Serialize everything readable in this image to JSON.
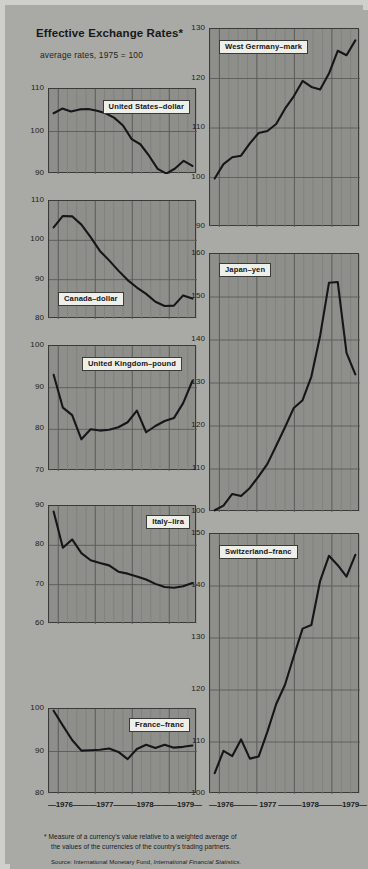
{
  "header": {
    "title": "Effective Exchange Rates*",
    "subtitle": "average rates, 1975 = 100"
  },
  "footnote": {
    "marker": "*",
    "line1": "Measure of a currency's value relative to a weighted average of",
    "line2": "the values of the currencies of the country's trading partners.",
    "source_prefix": "Source: International Monetary Fund, ",
    "source_italic": "International Financial Statistics."
  },
  "axis": {
    "years": [
      "1976",
      "1977",
      "1978",
      "1979"
    ],
    "left_label": "—1976———1977———1978———1979—",
    "right_label": "—1976——— 1977 ———1978———1979—"
  },
  "colors": {
    "background": "#a9aaa5",
    "plot_fill": "#8e8f8a",
    "plot_border": "#3a3b39",
    "line": "#15161a",
    "grid_minor": "#7e7f7b",
    "grid_major": "#5a5b58",
    "label_bg": "#efefea"
  },
  "chart_data": [
    {
      "type": "line",
      "title": "United States–dollar",
      "xlabel": "",
      "ylabel": "",
      "ylim": [
        90,
        110
      ],
      "yticks": [
        90,
        100,
        110
      ],
      "xlim": [
        1975.75,
        1979.75
      ],
      "grid": true,
      "legend": "inside-top-right",
      "x": [
        1975.875,
        1976.125,
        1976.375,
        1976.625,
        1976.875,
        1977.125,
        1977.375,
        1977.625,
        1977.875,
        1978.125,
        1978.375,
        1978.625,
        1978.875,
        1979.125,
        1979.375,
        1979.625
      ],
      "values": [
        104.3,
        105.4,
        104.7,
        105.2,
        105.3,
        104.9,
        104.3,
        103.2,
        101.4,
        98.2,
        97.0,
        94.3,
        91.2,
        90.1,
        91.3,
        93.1,
        91.9
      ]
    },
    {
      "type": "line",
      "title": "Canada–dollar",
      "xlabel": "",
      "ylabel": "",
      "ylim": [
        80,
        110
      ],
      "yticks": [
        80,
        90,
        100,
        110
      ],
      "xlim": [
        1975.75,
        1979.75
      ],
      "grid": true,
      "legend": "inside-bottom-left",
      "x": [
        1975.875,
        1976.125,
        1976.375,
        1976.625,
        1976.875,
        1977.125,
        1977.375,
        1977.625,
        1977.875,
        1978.125,
        1978.375,
        1978.625,
        1978.875,
        1979.125,
        1979.375,
        1979.625
      ],
      "values": [
        103.3,
        106.2,
        106.1,
        104.0,
        100.8,
        97.3,
        94.9,
        92.3,
        89.9,
        88.0,
        86.4,
        84.4,
        83.3,
        83.4,
        86.0,
        85.2
      ]
    },
    {
      "type": "line",
      "title": "United Kingdom–pound",
      "xlabel": "",
      "ylabel": "",
      "ylim": [
        70,
        100
      ],
      "yticks": [
        70,
        80,
        90,
        100
      ],
      "xlim": [
        1975.75,
        1979.75
      ],
      "grid": true,
      "legend": "inside-top-center",
      "x": [
        1975.875,
        1976.125,
        1976.375,
        1976.625,
        1976.875,
        1977.125,
        1977.375,
        1977.625,
        1977.875,
        1978.125,
        1978.375,
        1978.625,
        1978.875,
        1979.125,
        1979.375,
        1979.625
      ],
      "values": [
        93.1,
        85.2,
        83.4,
        77.6,
        80.0,
        79.7,
        79.9,
        80.5,
        81.7,
        84.5,
        79.3,
        80.8,
        82.0,
        82.7,
        86.3,
        91.6
      ]
    },
    {
      "type": "line",
      "title": "Italy–lira",
      "xlabel": "",
      "ylabel": "",
      "ylim": [
        60,
        90
      ],
      "yticks": [
        60,
        70,
        80,
        90
      ],
      "xlim": [
        1975.75,
        1979.75
      ],
      "grid": true,
      "legend": "inside-top-right",
      "x": [
        1975.875,
        1976.125,
        1976.375,
        1976.625,
        1976.875,
        1977.125,
        1977.375,
        1977.625,
        1977.875,
        1978.125,
        1978.375,
        1978.625,
        1978.875,
        1979.125,
        1979.375,
        1979.625
      ],
      "values": [
        88.6,
        79.4,
        81.5,
        78.0,
        76.2,
        75.5,
        74.9,
        73.3,
        72.8,
        72.1,
        71.3,
        70.2,
        69.4,
        69.2,
        69.6,
        70.4
      ]
    },
    {
      "type": "line",
      "title": "France–franc",
      "xlabel": "",
      "ylabel": "",
      "ylim": [
        80,
        100
      ],
      "yticks": [
        80,
        90,
        100
      ],
      "xlim": [
        1975.75,
        1979.75
      ],
      "grid": true,
      "legend": "inside-top-right",
      "x": [
        1975.875,
        1976.125,
        1976.375,
        1976.625,
        1976.875,
        1977.125,
        1977.375,
        1977.625,
        1977.875,
        1978.125,
        1978.375,
        1978.625,
        1978.875,
        1979.125,
        1979.375,
        1979.625
      ],
      "values": [
        99.6,
        96.1,
        92.7,
        90.2,
        90.3,
        90.4,
        90.7,
        89.9,
        88.2,
        90.6,
        91.6,
        90.8,
        91.6,
        90.9,
        91.1,
        91.4
      ]
    },
    {
      "type": "line",
      "title": "West Germany–mark",
      "xlabel": "",
      "ylabel": "",
      "ylim": [
        90,
        130
      ],
      "yticks": [
        90,
        100,
        110,
        120,
        130
      ],
      "xlim": [
        1975.75,
        1979.75
      ],
      "grid": true,
      "legend": "inside-top-left",
      "x": [
        1975.875,
        1976.125,
        1976.375,
        1976.625,
        1976.875,
        1977.125,
        1977.375,
        1977.625,
        1977.875,
        1978.125,
        1978.375,
        1978.625,
        1978.875,
        1979.125,
        1979.375,
        1979.625
      ],
      "values": [
        99.8,
        102.7,
        104.1,
        104.4,
        106.9,
        109.0,
        109.4,
        110.8,
        113.9,
        116.4,
        119.5,
        118.3,
        117.8,
        121.0,
        125.6,
        124.7,
        127.7
      ]
    },
    {
      "type": "line",
      "title": "Japan–yen",
      "xlabel": "",
      "ylabel": "",
      "ylim": [
        100,
        160
      ],
      "yticks": [
        100,
        110,
        120,
        130,
        140,
        150,
        160
      ],
      "xlim": [
        1975.75,
        1979.75
      ],
      "grid": true,
      "legend": "inside-top-left",
      "x": [
        1975.875,
        1976.125,
        1976.375,
        1976.625,
        1976.875,
        1977.125,
        1977.375,
        1977.625,
        1977.875,
        1978.125,
        1978.375,
        1978.625,
        1978.875,
        1979.125,
        1979.375,
        1979.625
      ],
      "values": [
        100.4,
        101.5,
        104.2,
        103.7,
        105.6,
        108.3,
        111.2,
        115.4,
        119.7,
        124.2,
        126.0,
        131.5,
        141.0,
        153.3,
        153.5,
        137.0,
        132.0
      ]
    },
    {
      "type": "line",
      "title": "Switzerland–franc",
      "xlabel": "",
      "ylabel": "",
      "ylim": [
        100,
        150
      ],
      "yticks": [
        100,
        110,
        120,
        130,
        140,
        150
      ],
      "xlim": [
        1975.75,
        1979.75
      ],
      "grid": true,
      "legend": "inside-top-left",
      "x": [
        1975.875,
        1976.125,
        1976.375,
        1976.625,
        1976.875,
        1977.125,
        1977.375,
        1977.625,
        1977.875,
        1978.125,
        1978.375,
        1978.625,
        1978.875,
        1979.125,
        1979.375,
        1979.625
      ],
      "values": [
        104.0,
        108.3,
        107.3,
        110.5,
        106.8,
        107.2,
        112.0,
        117.3,
        121.0,
        126.5,
        131.8,
        132.5,
        141.0,
        145.8,
        144.0,
        141.8,
        146.0
      ]
    }
  ]
}
